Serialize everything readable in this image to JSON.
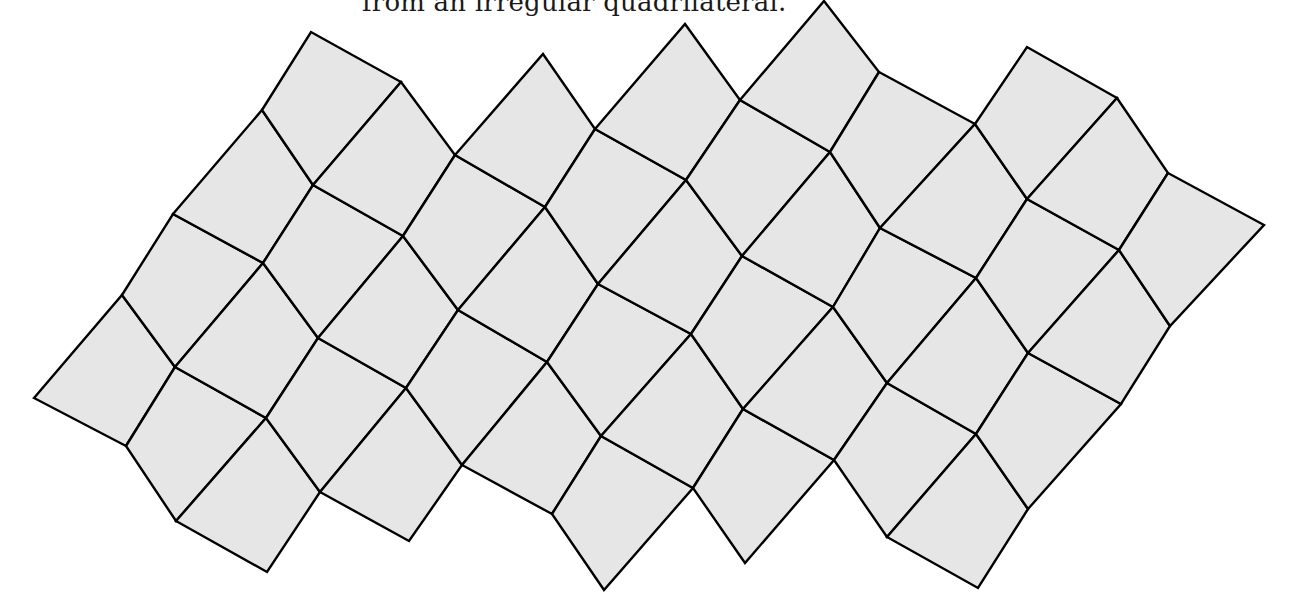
{
  "caption": {
    "text": "from an irregular quadrilateral."
  },
  "colors": {
    "tile_fill": "#e6e6e6",
    "edge": "#000000",
    "background": "#ffffff"
  },
  "tiling": {
    "description": "Tiling of the plane by congruent irregular quadrilaterals",
    "lines": [
      [
        [
          34,
          398
        ],
        [
          122,
          295
        ],
        [
          173,
          214
        ],
        [
          262,
          110
        ],
        [
          311,
          32
        ]
      ],
      [
        [
          126,
          446
        ],
        [
          175,
          367
        ],
        [
          263,
          263
        ],
        [
          313,
          185
        ],
        [
          401,
          82
        ]
      ],
      [
        [
          176,
          521
        ],
        [
          266,
          418
        ],
        [
          318,
          338
        ],
        [
          403,
          236
        ],
        [
          455,
          155
        ],
        [
          543,
          54
        ]
      ],
      [
        [
          267,
          572
        ],
        [
          320,
          492
        ],
        [
          406,
          388
        ],
        [
          458,
          310
        ],
        [
          545,
          207
        ],
        [
          595,
          129
        ],
        [
          685,
          24
        ]
      ],
      [
        [
          409,
          541
        ],
        [
          462,
          465
        ],
        [
          547,
          362
        ],
        [
          598,
          284
        ],
        [
          686,
          180
        ],
        [
          740,
          100
        ],
        [
          824,
          1
        ]
      ],
      [
        [
          552,
          514
        ],
        [
          601,
          436
        ],
        [
          691,
          334
        ],
        [
          742,
          256
        ],
        [
          830,
          152
        ],
        [
          879,
          72
        ]
      ],
      [
        [
          604,
          590
        ],
        [
          693,
          488
        ],
        [
          743,
          409
        ],
        [
          833,
          307
        ],
        [
          880,
          228
        ],
        [
          975,
          124
        ],
        [
          1027,
          47
        ]
      ],
      [
        [
          745,
          563
        ],
        [
          834,
          460
        ],
        [
          887,
          383
        ],
        [
          976,
          278
        ],
        [
          1027,
          199
        ],
        [
          1117,
          98
        ]
      ],
      [
        [
          887,
          537
        ],
        [
          976,
          434
        ],
        [
          1028,
          353
        ],
        [
          1119,
          250
        ],
        [
          1168,
          173
        ]
      ],
      [
        [
          978,
          588
        ],
        [
          1028,
          509
        ],
        [
          1121,
          404
        ],
        [
          1170,
          326
        ],
        [
          1264,
          225
        ]
      ]
    ],
    "offsets": [
      0,
      0,
      0,
      1,
      1,
      0,
      1,
      1,
      0
    ]
  }
}
